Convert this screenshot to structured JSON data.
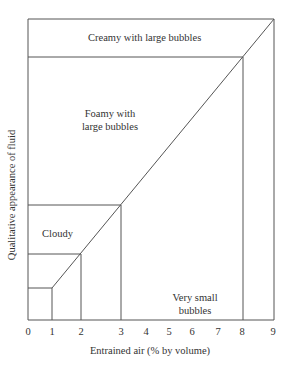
{
  "diagram": {
    "title": "",
    "x_axis_label": "Entrained air (% by volume)",
    "y_axis_label": "Qualitative appearance of fluid",
    "x_ticks": [
      "0",
      "1",
      "2",
      "3",
      "4",
      "5",
      "6",
      "7",
      "8",
      "9"
    ],
    "regions": {
      "creamy": "Creamy with large bubbles",
      "foamy_line1": "Foamy with",
      "foamy_line2": "large bubbles",
      "cloudy": "Cloudy",
      "very_small_line1": "Very small",
      "very_small_line2": "bubbles"
    },
    "boundaries_x_percent": [
      1,
      2,
      3,
      8,
      9
    ],
    "line_color": "#555555"
  }
}
